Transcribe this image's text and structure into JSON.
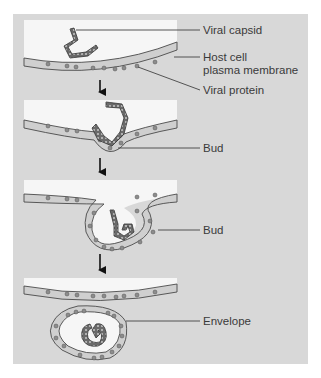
{
  "figure": {
    "type": "diagram",
    "colors": {
      "background": "#ffffff",
      "panel": "#d8d8d8",
      "cytoplasm": "#f6f6f6",
      "membrane_fill": "#cfcfcf",
      "membrane_stroke": "#4a4a4a",
      "protein": "#8c8c8c",
      "capsid": "#555555",
      "arrow": "#111111",
      "leader": "#444444",
      "text": "#3a3a3a"
    },
    "stages": [
      {
        "step": 1,
        "labels": [
          "Viral capsid",
          "Host cell",
          "plasma membrane",
          "Viral protein"
        ]
      },
      {
        "step": 2,
        "labels": [
          "Bud"
        ]
      },
      {
        "step": 3,
        "labels": [
          "Bud"
        ]
      },
      {
        "step": 4,
        "labels": [
          "Envelope"
        ]
      }
    ]
  },
  "labels": {
    "viral_capsid": "Viral capsid",
    "host_cell_line1": "Host cell",
    "host_cell_line2": "plasma membrane",
    "viral_protein": "Viral protein",
    "bud_1": "Bud",
    "bud_2": "Bud",
    "envelope": "Envelope"
  }
}
